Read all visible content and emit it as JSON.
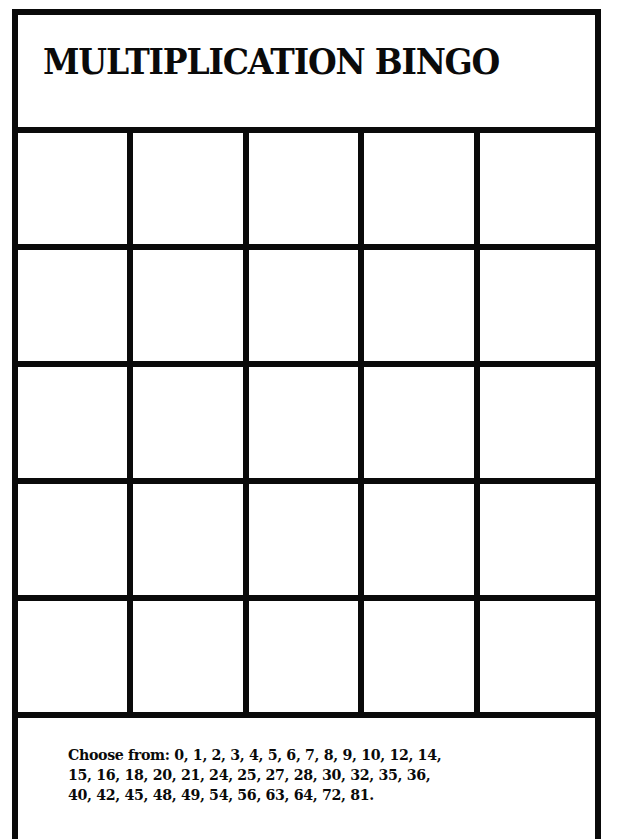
{
  "title": "MULTIPLICATION BINGO",
  "grid": {
    "rows": 5,
    "columns": 5,
    "cells": [
      [
        "",
        "",
        "",
        "",
        ""
      ],
      [
        "",
        "",
        "",
        "",
        ""
      ],
      [
        "",
        "",
        "",
        "",
        ""
      ],
      [
        "",
        "",
        "",
        "",
        ""
      ],
      [
        "",
        "",
        "",
        "",
        ""
      ]
    ]
  },
  "footer": {
    "label": "Choose from:",
    "numbers": [
      0,
      1,
      2,
      3,
      4,
      5,
      6,
      7,
      8,
      9,
      10,
      12,
      14,
      15,
      16,
      18,
      20,
      21,
      24,
      25,
      27,
      28,
      30,
      32,
      35,
      36,
      40,
      42,
      45,
      48,
      49,
      54,
      56,
      63,
      64,
      72,
      81
    ],
    "lines": [
      "Choose from: 0, 1, 2, 3, 4, 5, 6, 7, 8, 9, 10, 12, 14,",
      "15, 16, 18, 20, 21, 24, 25, 27, 28, 30, 32, 35, 36,",
      "40, 42, 45, 48, 49, 54, 56, 63, 64, 72, 81."
    ]
  },
  "colors": {
    "line": "#0a0a0a",
    "background": "#ffffff"
  }
}
